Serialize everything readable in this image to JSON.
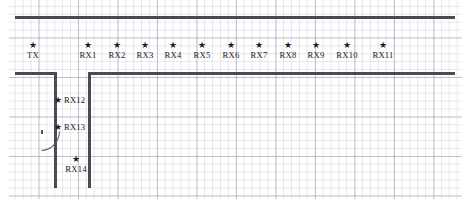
{
  "figure": {
    "kind": "floorplan-measurement-layout",
    "background_color": "#ffffff",
    "grid_color": "#9696a5",
    "wall_color": "#4a4a52",
    "marker_color": "#1c1c22",
    "marker_glyph": "★"
  },
  "nodes": [
    {
      "id": "tx",
      "label": "TX",
      "star_x": 33,
      "star_y": 45,
      "label_x": 33,
      "label_y": 51,
      "placement": "below"
    },
    {
      "id": "rx1",
      "label": "RX1",
      "star_x": 88,
      "star_y": 45,
      "label_x": 88,
      "label_y": 51,
      "placement": "below"
    },
    {
      "id": "rx2",
      "label": "RX2",
      "star_x": 117,
      "star_y": 45,
      "label_x": 117,
      "label_y": 51,
      "placement": "below"
    },
    {
      "id": "rx3",
      "label": "RX3",
      "star_x": 145,
      "star_y": 45,
      "label_x": 145,
      "label_y": 51,
      "placement": "below"
    },
    {
      "id": "rx4",
      "label": "RX4",
      "star_x": 173,
      "star_y": 45,
      "label_x": 173,
      "label_y": 51,
      "placement": "below"
    },
    {
      "id": "rx5",
      "label": "RX5",
      "star_x": 202,
      "star_y": 45,
      "label_x": 202,
      "label_y": 51,
      "placement": "below"
    },
    {
      "id": "rx6",
      "label": "RX6",
      "star_x": 231,
      "star_y": 45,
      "label_x": 231,
      "label_y": 51,
      "placement": "below"
    },
    {
      "id": "rx7",
      "label": "RX7",
      "star_x": 259,
      "star_y": 45,
      "label_x": 259,
      "label_y": 51,
      "placement": "below"
    },
    {
      "id": "rx8",
      "label": "RX8",
      "star_x": 288,
      "star_y": 45,
      "label_x": 288,
      "label_y": 51,
      "placement": "below"
    },
    {
      "id": "rx9",
      "label": "RX9",
      "star_x": 316,
      "star_y": 45,
      "label_x": 316,
      "label_y": 51,
      "placement": "below"
    },
    {
      "id": "rx10",
      "label": "RX10",
      "star_x": 347,
      "star_y": 45,
      "label_x": 347,
      "label_y": 51,
      "placement": "below"
    },
    {
      "id": "rx11",
      "label": "RX11",
      "star_x": 383,
      "star_y": 45,
      "label_x": 383,
      "label_y": 51,
      "placement": "below"
    },
    {
      "id": "rx12",
      "label": "RX12",
      "star_x": 58,
      "star_y": 100,
      "label_x": 64,
      "label_y": 100,
      "placement": "right"
    },
    {
      "id": "rx13",
      "label": "RX13",
      "star_x": 58,
      "star_y": 127,
      "label_x": 64,
      "label_y": 127,
      "placement": "right"
    },
    {
      "id": "rx14",
      "label": "RX14",
      "star_x": 76,
      "star_y": 159,
      "label_x": 76,
      "label_y": 165,
      "placement": "below"
    }
  ],
  "walls": [
    {
      "id": "corridor-top",
      "orientation": "h",
      "x": 15,
      "y": 16,
      "length": 440
    },
    {
      "id": "corridor-bottom-left",
      "orientation": "h",
      "x": 15,
      "y": 72,
      "length": 41
    },
    {
      "id": "corridor-bottom-right",
      "orientation": "h",
      "x": 88,
      "y": 72,
      "length": 367
    },
    {
      "id": "room-left-wall",
      "orientation": "v",
      "x": 54.4,
      "y": 72,
      "length": 116
    },
    {
      "id": "room-right-wall",
      "orientation": "v",
      "x": 88,
      "y": 72,
      "length": 116
    }
  ],
  "door": {
    "id": "room-door",
    "hinge_x": 41,
    "hinge_y": 131,
    "swing_radius": 17
  }
}
